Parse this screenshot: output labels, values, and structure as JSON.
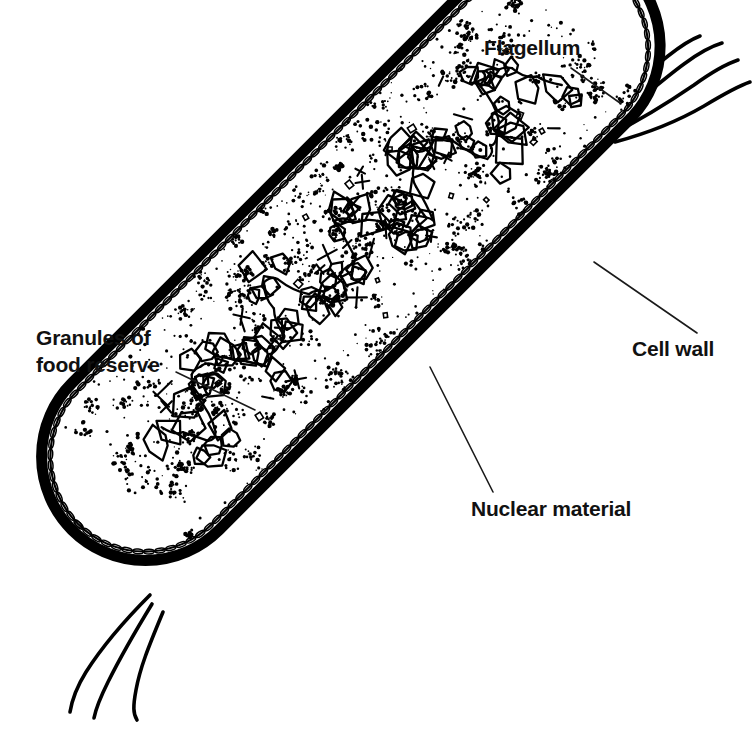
{
  "figure": {
    "style": "black-and-white line drawing",
    "background_color": "#ffffff",
    "ink_color": "#000000",
    "canvas": {
      "width": 755,
      "height": 754
    }
  },
  "labels": [
    {
      "id": "flagellum",
      "text": "Flagellum",
      "x": 484,
      "y": 55,
      "anchor": "start",
      "leader": {
        "from_x": 571,
        "from_y": 68,
        "to_x": 620,
        "to_y": 103
      }
    },
    {
      "id": "cell-wall",
      "text": "Cell wall",
      "x": 632,
      "y": 356,
      "anchor": "start",
      "leader": {
        "from_x": 697,
        "from_y": 333,
        "to_x": 594,
        "to_y": 262
      }
    },
    {
      "id": "granules-line-1",
      "text": "Granules of",
      "x": 36,
      "y": 345,
      "anchor": "start",
      "leader": null
    },
    {
      "id": "granules-line-2",
      "text": "food reserve",
      "x": 36,
      "y": 372,
      "anchor": "start",
      "leader": {
        "from_x": 176,
        "from_y": 372,
        "to_x": 255,
        "to_y": 410
      }
    },
    {
      "id": "nuclear-material",
      "text": "Nuclear material",
      "x": 471,
      "y": 516,
      "anchor": "start",
      "leader": {
        "from_x": 493,
        "from_y": 492,
        "to_x": 430,
        "to_y": 367
      }
    }
  ],
  "structures": {
    "cell_body": {
      "name": "bacterial cell body",
      "shape": "rod / capsule",
      "orientation_degrees": -45,
      "center_x": 372,
      "center_y": 370,
      "length": 600,
      "width": 208
    },
    "cell_wall": {
      "name": "cell wall",
      "description": "thick double-layered braided outer boundary",
      "thickness": 11
    },
    "cytoplasm": {
      "name": "cytoplasm",
      "description": "stippled interior containing food-reserve granules"
    },
    "granules": {
      "name": "granules of food reserve",
      "description": "clusters of fine stipple dots distributed through the cytoplasm",
      "cluster_count": 150
    },
    "nuclear_material": {
      "name": "nuclear material",
      "description": "irregular interlocking polygon chain along the long axis of the cell"
    },
    "flagella": {
      "name": "flagella",
      "top_right_count": 4,
      "bottom_left_count": 3,
      "total": 7
    }
  }
}
